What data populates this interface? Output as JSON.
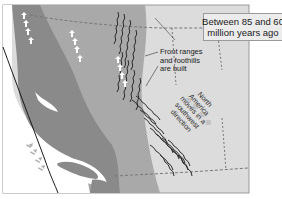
{
  "title": {
    "line1": "Between 85 and 60",
    "line2": "million years ago"
  },
  "callout": {
    "line1": "Front ranges",
    "line2": "and foothills",
    "line3": "are built"
  },
  "motion_label": {
    "line1": "North",
    "line2": "America",
    "line3": "moves in a",
    "line4": "southwest",
    "line5": "direction"
  },
  "colors": {
    "ocean": "#ffffff",
    "dark_band": "#8a8a8a",
    "mid_band": "#a6a6a6",
    "light_land": "#dcdcdc",
    "mountains": "#2b2b2b",
    "frame": "#9a9a9a"
  },
  "icons": {
    "plate_arrows_up": "white-up-arrow-icon",
    "plate_arrows_diag": "gray-northeast-arrow-icon",
    "motion_arrows": "gray-southwest-arrow-icon",
    "mountain_ridges": "squiggle-ridge-icon"
  }
}
